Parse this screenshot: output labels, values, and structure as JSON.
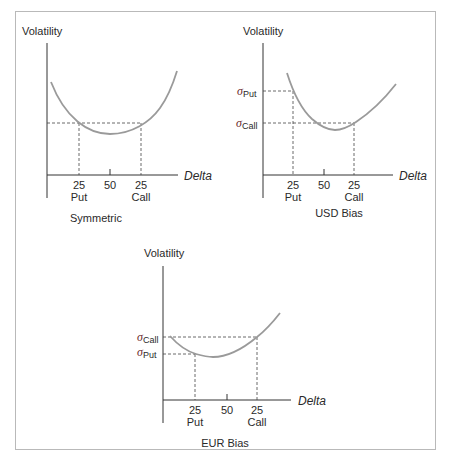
{
  "figure": {
    "panels": [
      {
        "id": "symmetric",
        "caption": "Symmetric",
        "y_label": "Volatility",
        "x_label": "Delta",
        "ticks": [
          {
            "top": "25",
            "bottom": "Put"
          },
          {
            "top": "50",
            "bottom": ""
          },
          {
            "top": "25",
            "bottom": "Call"
          }
        ],
        "sigma_labels": []
      },
      {
        "id": "usd-bias",
        "caption": "USD Bias",
        "y_label": "Volatility",
        "x_label": "Delta",
        "ticks": [
          {
            "top": "25",
            "bottom": "Put"
          },
          {
            "top": "50",
            "bottom": ""
          },
          {
            "top": "25",
            "bottom": "Call"
          }
        ],
        "sigma_labels": [
          {
            "symbol": "σ",
            "sub": "Put"
          },
          {
            "symbol": "σ",
            "sub": "Call"
          }
        ]
      },
      {
        "id": "eur-bias",
        "caption": "EUR Bias",
        "y_label": "Volatility",
        "x_label": "Delta",
        "ticks": [
          {
            "top": "25",
            "bottom": "Put"
          },
          {
            "top": "50",
            "bottom": ""
          },
          {
            "top": "25",
            "bottom": "Call"
          }
        ],
        "sigma_labels": [
          {
            "symbol": "σ",
            "sub": "Call"
          },
          {
            "symbol": "σ",
            "sub": "Put"
          }
        ]
      }
    ]
  },
  "colors": {
    "curve": "#9a9a9a",
    "axis": "#333333",
    "frame": "#b9b9b9",
    "sigma": "#6a2a2a"
  }
}
